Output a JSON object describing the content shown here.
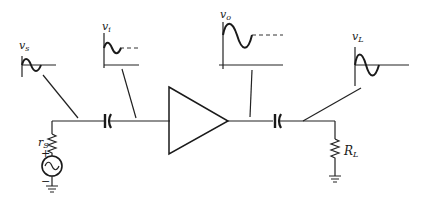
{
  "diagram": {
    "type": "amplifier circuit with signal waveforms",
    "colors": {
      "ink": "#1a1a1a",
      "background": "#ffffff"
    },
    "labels": {
      "vs": {
        "main": "v",
        "sub": "s"
      },
      "vi": {
        "main": "v",
        "sub": "i"
      },
      "vo": {
        "main": "v",
        "sub": "o"
      },
      "vL": {
        "main": "v",
        "sub": "L"
      },
      "rs": {
        "main": "r",
        "sub": "S"
      },
      "RL": {
        "main": "R",
        "sub": "L"
      },
      "plus": "+",
      "minus": "−"
    },
    "components": [
      "source-resistor rS",
      "ac-voltage-source",
      "input-coupling-capacitor",
      "amplifier",
      "output-coupling-capacitor",
      "load-resistor RL",
      "ground-source",
      "ground-load"
    ],
    "waveforms": [
      {
        "name": "vs",
        "dc_offset": false,
        "amplitude": "small"
      },
      {
        "name": "vi",
        "dc_offset": true,
        "amplitude": "small"
      },
      {
        "name": "vo",
        "dc_offset": true,
        "amplitude": "large"
      },
      {
        "name": "vL",
        "dc_offset": false,
        "amplitude": "large"
      }
    ]
  }
}
